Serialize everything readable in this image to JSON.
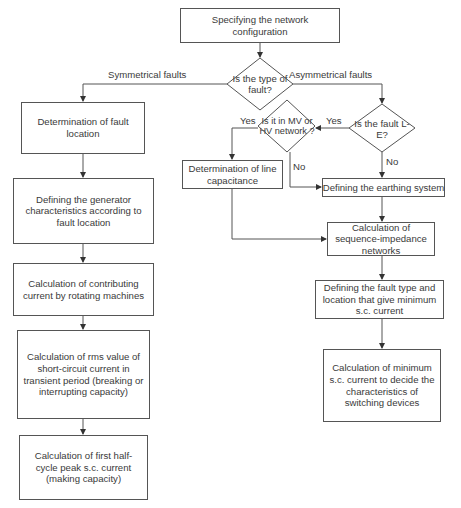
{
  "diagram": {
    "type": "flowchart",
    "nodes": {
      "start": "Specifying the network configuration",
      "decision_fault_type": "Is the type of fault?",
      "sym_fault_location": "Determination of fault location",
      "sym_generator": "Defining the generator characteristics according to fault location",
      "sym_contributing": "Calculation of contributing current by rotating machines",
      "sym_rms": "Calculation of rms value of short-circuit current in transient period (breaking or interrupting capacity)",
      "sym_peak": "Calculation of first half-cycle peak s.c. current (making capacity)",
      "decision_le": "Is the fault L-E?",
      "decision_mv_hv": "Is it in MV or HV network ?",
      "line_capacitance": "Determination of line capacitance",
      "earthing": "Defining the earthing system",
      "sequence": "Calculation of sequence-impedance networks",
      "fault_type_min": "Defining the fault type and location that give minimum s.c. current",
      "min_sc": "Calculation of minimum s.c. current to decide the characteristics of switching devices"
    },
    "edge_labels": {
      "symmetrical": "Symmetrical faults",
      "asymmetrical": "Asymmetrical faults",
      "le_yes": "Yes",
      "le_no": "No",
      "mv_yes": "Yes",
      "mv_no": "No"
    },
    "colors": {
      "line": "#555555",
      "text": "#3a3a3a",
      "background": "#ffffff"
    }
  }
}
